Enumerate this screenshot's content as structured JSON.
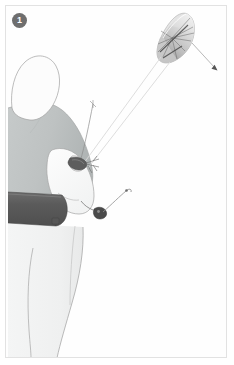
{
  "figure": {
    "step_badge": "1",
    "badge_color": "#6e6e6e",
    "badge_text_color": "#ffffff",
    "frame_border_color": "#e2e2e2",
    "background_color": "#ffffff"
  },
  "palette": {
    "shirt_gray": "#bfc3c3",
    "shirt_shadow": "#aeb3b3",
    "harness_dark": "#5a5a5a",
    "harness_highlight": "#6e6e6e",
    "skin_light": "#fbfbfb",
    "pants_light": "#f1f2f2",
    "outline_gray": "#9a9a9a",
    "line_faint": "#d8d8d8",
    "line_thin": "#8d8d8d",
    "hardware_dark": "#4a4a4a",
    "kite_light": "#f2f2f2",
    "kite_mid": "#c9c9c9",
    "kite_dark": "#8f8f8f",
    "kite_seam": "#5f5f5f"
  },
  "elements": {
    "kite_label": "kite canopy",
    "kite_tip_arrow_label": "kite wingtip arrow",
    "rider_label": "rider figure",
    "head_label": "rider head",
    "torso_label": "rider torso in shirt",
    "arm_label": "rider arm",
    "harness_label": "waist harness belt",
    "legs_label": "rider legs",
    "control_bar_label": "control bar grip",
    "chicken_loop_label": "chicken loop knob",
    "safety_leash_label": "safety leash hook",
    "front_line_label": "kite front line",
    "back_line_label": "kite back line",
    "depower_line_label": "depower line"
  }
}
